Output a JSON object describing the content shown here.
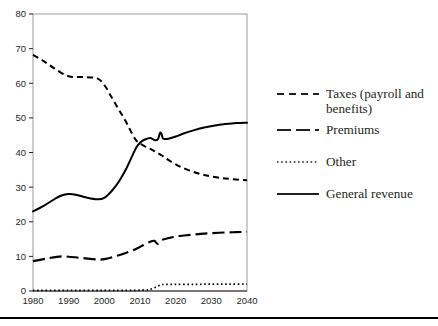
{
  "chart_data": {
    "type": "line",
    "title": "",
    "xlabel": "",
    "ylabel": "",
    "xlim": [
      1980,
      2040
    ],
    "ylim": [
      0,
      80
    ],
    "ytick_step": 10,
    "xtick_step": 10,
    "grid": false,
    "legend_position": "right",
    "xticks": [
      "1980",
      "1990",
      "2000",
      "2010",
      "2020",
      "2030",
      "2040"
    ],
    "yticks": [
      "0",
      "10",
      "20",
      "30",
      "40",
      "50",
      "60",
      "70",
      "80"
    ],
    "series": [
      {
        "name": "Taxes (payroll and benefits)",
        "label_lines": "Taxes (payroll and\nbenefits)",
        "style": "dashed-short",
        "color": "#000000",
        "x": [
          1980,
          1983,
          1986,
          1990,
          1994,
          1998,
          2000,
          2002,
          2004,
          2006,
          2008,
          2009,
          2010,
          2011,
          2012,
          2013,
          2014,
          2015,
          2016,
          2017,
          2018,
          2020,
          2022,
          2025,
          2028,
          2030,
          2033,
          2036,
          2040
        ],
        "values": [
          68.2,
          66.4,
          64.3,
          62.0,
          61.8,
          61.4,
          59.5,
          56.0,
          52.5,
          49.0,
          45.0,
          43.4,
          42.6,
          42.0,
          41.4,
          41.0,
          40.4,
          39.8,
          39.2,
          38.5,
          37.8,
          36.6,
          35.6,
          34.4,
          33.5,
          33.1,
          32.6,
          32.3,
          32.0
        ]
      },
      {
        "name": "Premiums",
        "label_lines": "Premiums",
        "style": "dashed-long",
        "color": "#000000",
        "x": [
          1980,
          1984,
          1988,
          1990,
          1994,
          1998,
          2000,
          2003,
          2006,
          2009,
          2011,
          2013,
          2014,
          2015,
          2016,
          2017,
          2019,
          2021,
          2024,
          2027,
          2030,
          2034,
          2037,
          2040
        ],
        "values": [
          8.6,
          9.4,
          10.0,
          9.9,
          9.5,
          9.1,
          9.2,
          10.0,
          11.0,
          12.2,
          13.3,
          14.3,
          14.5,
          13.6,
          14.6,
          15.0,
          15.5,
          15.9,
          16.2,
          16.5,
          16.7,
          16.9,
          17.0,
          17.1
        ]
      },
      {
        "name": "Other",
        "label_lines": "Other",
        "style": "dotted",
        "color": "#000000",
        "x": [
          1980,
          1990,
          2000,
          2008,
          2012,
          2013,
          2014,
          2015,
          2016,
          2017,
          2020,
          2025,
          2030,
          2035,
          2040
        ],
        "values": [
          0.2,
          0.2,
          0.2,
          0.2,
          0.3,
          0.5,
          0.9,
          1.4,
          1.8,
          1.9,
          1.9,
          1.9,
          2.0,
          2.0,
          2.0
        ]
      },
      {
        "name": "General revenue",
        "label_lines": "General revenue",
        "style": "solid",
        "color": "#000000",
        "x": [
          1980,
          1983,
          1986,
          1988,
          1990,
          1992,
          1995,
          1998,
          2000,
          2002,
          2004,
          2006,
          2008,
          2009,
          2010,
          2011,
          2012,
          2013,
          2014,
          2015,
          2015.6,
          2016,
          2016.4,
          2017,
          2018,
          2020,
          2022,
          2025,
          2028,
          2031,
          2034,
          2037,
          2040
        ],
        "values": [
          23.0,
          24.6,
          26.5,
          27.6,
          28.0,
          27.8,
          27.0,
          26.5,
          26.9,
          28.8,
          31.5,
          35.0,
          39.4,
          41.5,
          42.8,
          43.6,
          44.0,
          44.2,
          43.6,
          43.8,
          45.6,
          45.5,
          44.1,
          43.9,
          44.0,
          44.6,
          45.4,
          46.4,
          47.2,
          47.8,
          48.2,
          48.5,
          48.6
        ]
      }
    ]
  }
}
